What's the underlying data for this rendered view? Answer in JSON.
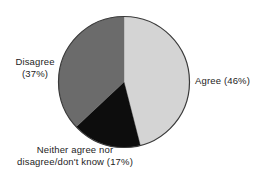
{
  "chart_data": {
    "type": "pie",
    "title": "",
    "categories": [
      "Agree",
      "Neither agree nor disagree/don't know",
      "Disagree"
    ],
    "values": [
      46,
      17,
      37
    ],
    "value_unit": "percent",
    "colors": [
      "#d4d4d4",
      "#0d0d0d",
      "#6b6b6b"
    ],
    "outline_color": "#3a3a3a",
    "start_angle_deg": 0,
    "direction": "clockwise",
    "legend": "none",
    "labels_position": "outside-callout",
    "background": "#ffffff"
  },
  "labels": {
    "agree": {
      "line1": "Agree (46%)"
    },
    "disagree": {
      "line1": "Disagree",
      "line2": "(37%)"
    },
    "neither": {
      "line1": "Neither agree nor",
      "line2": "disagree/don't know (17%)"
    }
  }
}
